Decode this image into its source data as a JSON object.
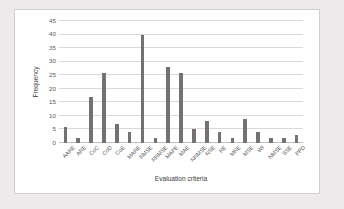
{
  "chart_data": {
    "type": "bar",
    "title": "",
    "xlabel": "Evaluation criteria",
    "ylabel": "Frequency",
    "ylim": [
      0,
      45
    ],
    "ytick_step": 5,
    "yticks": [
      0,
      5,
      10,
      15,
      20,
      25,
      30,
      35,
      40,
      45
    ],
    "grid": true,
    "legend": "none",
    "bar_color": "#767171",
    "gridline_color": "#d9d9d9",
    "plot_background": "#ffffff",
    "page_background": "#eceaea",
    "categories": [
      "AARE",
      "ARE",
      "CoC",
      "CoD",
      "CoE",
      "MARE",
      "RMSE",
      "RRMSE",
      "MAPE",
      "MAE",
      "NRMSE",
      "NSE",
      "RE",
      "MRE",
      "MSE",
      "WI",
      "NMSE",
      "SSE",
      "PPD"
    ],
    "values": [
      6,
      2,
      17,
      26,
      7,
      4,
      40,
      2,
      28,
      26,
      5,
      8,
      4,
      2,
      9,
      4,
      2,
      2,
      3
    ]
  }
}
